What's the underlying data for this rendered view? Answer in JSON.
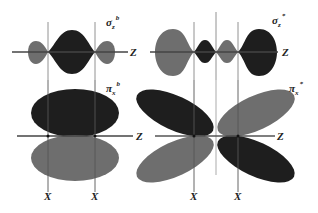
{
  "colors": {
    "dark_lobe": "#1e1e1e",
    "gray_lobe": "#6e6e6e",
    "axis": "#555555",
    "background": "#ffffff"
  },
  "panels": [
    {
      "id": "sigma-bonding",
      "label_main": "σ",
      "label_sub": "z",
      "label_sup": "b",
      "axis_label": "Z"
    },
    {
      "id": "sigma-antibonding",
      "label_main": "σ",
      "label_sub": "z",
      "label_sup": "*",
      "axis_label": "Z"
    },
    {
      "id": "pi-bonding",
      "label_main": "π",
      "label_sub": "x",
      "label_sup": "b",
      "axis_label": "Z",
      "x_labels": [
        "X",
        "X"
      ]
    },
    {
      "id": "pi-antibonding",
      "label_main": "π",
      "label_sub": "x",
      "label_sup": "*",
      "axis_label": "Z",
      "x_labels": [
        "X",
        "X"
      ]
    }
  ]
}
